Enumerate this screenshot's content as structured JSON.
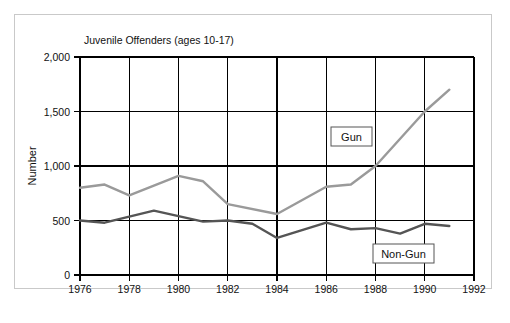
{
  "chart_data": {
    "type": "line",
    "title": "Juvenile Offenders (ages 10-17)",
    "xlabel": "",
    "ylabel": "Number",
    "xlim": [
      1976,
      1992
    ],
    "ylim": [
      0,
      2000
    ],
    "grid": true,
    "legend_position": "inside-plot",
    "x_ticks": [
      "1976",
      "1978",
      "1980",
      "1982",
      "1984",
      "1986",
      "1988",
      "1990",
      "1992"
    ],
    "x_tick_values": [
      1976,
      1978,
      1980,
      1982,
      1984,
      1986,
      1988,
      1990,
      1992
    ],
    "y_ticks": [
      "0",
      "500",
      "1,000",
      "1,500",
      "2,000"
    ],
    "y_tick_values": [
      0,
      500,
      1000,
      1500,
      2000
    ],
    "series": [
      {
        "name": "Gun",
        "color": "#9a9a9a",
        "x": [
          1976,
          1977,
          1978,
          1980,
          1981,
          1982,
          1984,
          1986,
          1987,
          1988,
          1990,
          1991
        ],
        "values": [
          800,
          830,
          730,
          910,
          860,
          650,
          560,
          810,
          830,
          1000,
          1500,
          1700
        ]
      },
      {
        "name": "Non-Gun",
        "color": "#555555",
        "x": [
          1976,
          1977,
          1979,
          1981,
          1982,
          1983,
          1984,
          1986,
          1987,
          1988,
          1989,
          1990,
          1991
        ],
        "values": [
          500,
          480,
          590,
          490,
          500,
          470,
          340,
          480,
          420,
          430,
          380,
          470,
          450
        ]
      }
    ],
    "annotations": [
      {
        "text": "Gun",
        "x": 1987.4,
        "y": 1270
      },
      {
        "text": "Non-Gun",
        "x": 1989.6,
        "y": 200
      }
    ]
  }
}
